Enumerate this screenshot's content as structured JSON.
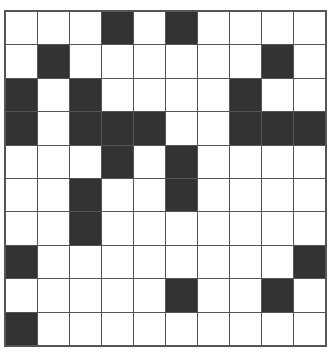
{
  "puzzle": {
    "title": "",
    "rows": 10,
    "cols": 10,
    "colors": {
      "filled": "#333333",
      "empty": "#ffffff",
      "grid_line": "#555555"
    },
    "grid": [
      [
        0,
        0,
        0,
        1,
        0,
        1,
        0,
        0,
        0,
        0
      ],
      [
        0,
        1,
        0,
        0,
        0,
        0,
        0,
        0,
        1,
        0
      ],
      [
        1,
        0,
        1,
        0,
        0,
        0,
        0,
        1,
        0,
        0
      ],
      [
        1,
        0,
        1,
        1,
        1,
        0,
        0,
        1,
        1,
        1
      ],
      [
        0,
        0,
        0,
        1,
        0,
        1,
        0,
        0,
        0,
        0
      ],
      [
        0,
        0,
        1,
        0,
        0,
        1,
        0,
        0,
        0,
        0
      ],
      [
        0,
        0,
        1,
        0,
        0,
        0,
        0,
        0,
        0,
        0
      ],
      [
        1,
        0,
        0,
        0,
        0,
        0,
        0,
        0,
        0,
        1
      ],
      [
        0,
        0,
        0,
        0,
        0,
        1,
        0,
        0,
        1,
        0
      ],
      [
        1,
        0,
        0,
        0,
        0,
        0,
        0,
        0,
        0,
        0
      ]
    ]
  }
}
